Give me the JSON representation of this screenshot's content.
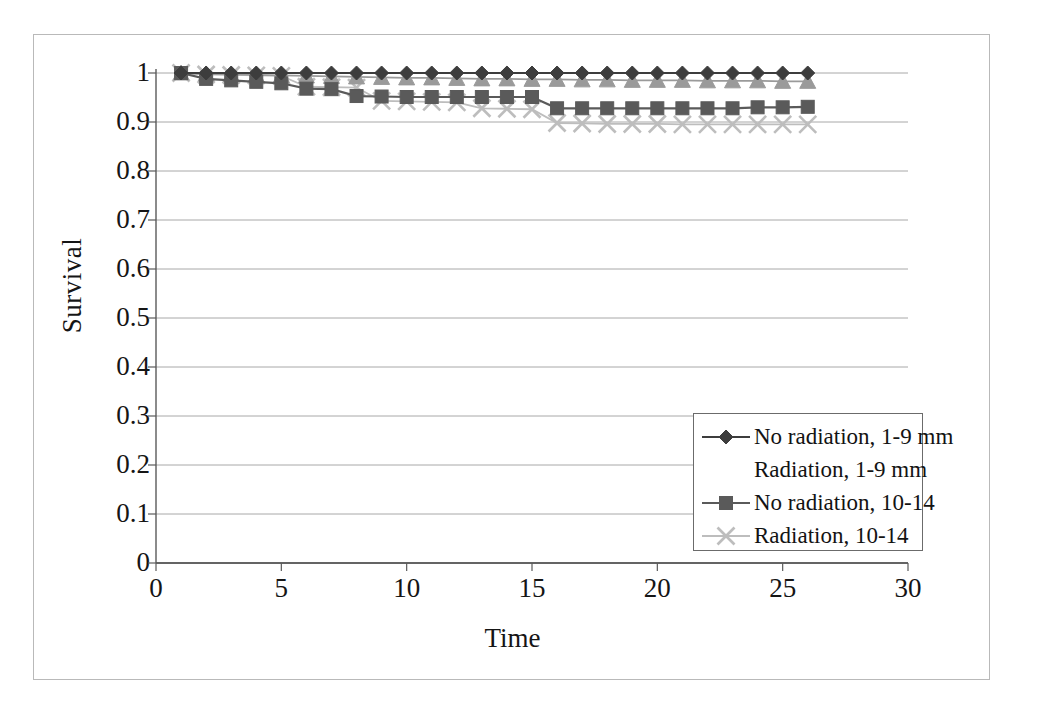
{
  "chart_data": {
    "type": "line",
    "title": "",
    "xlabel": "Time",
    "ylabel": "Survival",
    "xlim": [
      0,
      30
    ],
    "ylim": [
      0,
      1
    ],
    "xticks": [
      0,
      5,
      10,
      15,
      20,
      25,
      30
    ],
    "xtick_labels": [
      "0",
      "5",
      "10",
      "15",
      "20",
      "25",
      "30"
    ],
    "yticks": [
      0,
      0.1,
      0.2,
      0.3,
      0.4,
      0.5,
      0.6,
      0.7,
      0.8,
      0.9,
      1
    ],
    "ytick_labels": [
      "0",
      "0.1",
      "0.2",
      "0.3",
      "0.4",
      "0.5",
      "0.6",
      "0.7",
      "0.8",
      "0.9",
      "1"
    ],
    "grid": "horizontal",
    "legend_position": "center-right",
    "x": [
      1,
      2,
      3,
      4,
      5,
      6,
      7,
      8,
      9,
      10,
      11,
      12,
      13,
      14,
      15,
      16,
      17,
      18,
      19,
      20,
      21,
      22,
      23,
      24,
      25,
      26
    ],
    "series": [
      {
        "name": "No radiation, 1-9 mm",
        "marker": "diamond",
        "color": "#3d3d3d",
        "values": [
          1.0,
          1.0,
          1.0,
          1.0,
          1.0,
          1.0,
          1.0,
          1.0,
          1.0,
          1.0,
          1.0,
          1.0,
          1.0,
          1.0,
          1.0,
          1.0,
          1.0,
          1.0,
          1.0,
          1.0,
          1.0,
          1.0,
          1.0,
          1.0,
          1.0,
          1.0
        ]
      },
      {
        "name": "Radiation, 1-9 mm",
        "marker": "triangle",
        "color": "#9a9a9a",
        "values": [
          1.0,
          0.998,
          0.997,
          0.996,
          0.995,
          0.994,
          0.993,
          0.992,
          0.991,
          0.99,
          0.99,
          0.989,
          0.988,
          0.988,
          0.987,
          0.987,
          0.986,
          0.986,
          0.985,
          0.985,
          0.985,
          0.984,
          0.984,
          0.984,
          0.983,
          0.983
        ]
      },
      {
        "name": "No radiation, 10-14",
        "marker": "square",
        "color": "#5a5a5a",
        "values": [
          1.0,
          0.988,
          0.985,
          0.982,
          0.979,
          0.968,
          0.967,
          0.953,
          0.952,
          0.951,
          0.951,
          0.951,
          0.951,
          0.951,
          0.951,
          0.928,
          0.928,
          0.928,
          0.928,
          0.928,
          0.928,
          0.928,
          0.928,
          0.93,
          0.93,
          0.931
        ]
      },
      {
        "name": "Radiation, 10-14",
        "marker": "x",
        "color": "#bdbdbd",
        "values": [
          1.0,
          0.997,
          0.996,
          0.995,
          0.994,
          0.972,
          0.971,
          0.97,
          0.943,
          0.942,
          0.941,
          0.94,
          0.928,
          0.927,
          0.926,
          0.898,
          0.897,
          0.896,
          0.896,
          0.896,
          0.895,
          0.895,
          0.895,
          0.895,
          0.895,
          0.895
        ]
      }
    ]
  },
  "legend": {
    "items": [
      {
        "label": "No radiation, 1-9 mm"
      },
      {
        "label": "Radiation, 1-9 mm"
      },
      {
        "label": "No radiation, 10-14"
      },
      {
        "label": "Radiation, 10-14"
      }
    ]
  },
  "axes": {
    "y_title": "Survival",
    "x_title": "Time"
  }
}
